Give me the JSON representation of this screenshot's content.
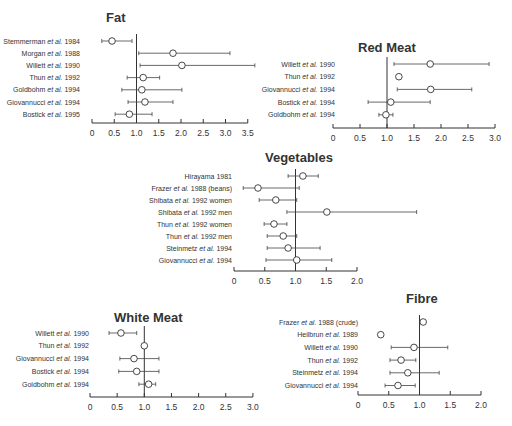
{
  "chart_data": [
    {
      "type": "forest",
      "title": "Fat",
      "xlim": [
        0,
        3.5
      ],
      "xticks": [
        "0",
        "0.5",
        "1.0",
        "1.5",
        "2.0",
        "2.5",
        "3.0",
        "3.5"
      ],
      "reference_line": 1.0,
      "layout": {
        "x0": 92,
        "unit": 44.5,
        "label_right": 80,
        "title_x": 106,
        "title_y": 22,
        "row_y0": 41,
        "row_dy": 12.2,
        "axis_y": 123
      },
      "studies": [
        {
          "label": "Stemmerman et al. 1984",
          "estimate": 0.45,
          "lower": 0.22,
          "upper": 0.9
        },
        {
          "label": "Morgan et al. 1988",
          "estimate": 1.82,
          "lower": 1.05,
          "upper": 3.1
        },
        {
          "label": "Willett et al. 1990",
          "estimate": 2.02,
          "lower": 1.08,
          "upper": 3.66
        },
        {
          "label": "Thun et al. 1992",
          "estimate": 1.15,
          "lower": 0.79,
          "upper": 1.52
        },
        {
          "label": "Goldbohm et al. 1994",
          "estimate": 1.12,
          "lower": 0.67,
          "upper": 2.02
        },
        {
          "label": "Giovannucci et al. 1994",
          "estimate": 1.19,
          "lower": 0.81,
          "upper": 1.82
        },
        {
          "label": "Bostick et al. 1995",
          "estimate": 0.84,
          "lower": 0.52,
          "upper": 1.35
        }
      ]
    },
    {
      "type": "forest",
      "title": "Red Meat",
      "xlim": [
        0,
        3.0
      ],
      "xticks": [
        "0",
        "0.5",
        "1.0",
        "1.5",
        "2.0",
        "2.5",
        "3.0"
      ],
      "reference_line": 1.0,
      "layout": {
        "x0": 333,
        "unit": 54,
        "label_right": 335,
        "title_x": 358,
        "title_y": 52,
        "row_y0": 64,
        "row_dy": 12.7,
        "axis_y": 128
      },
      "studies": [
        {
          "label": "Willett et al. 1990",
          "estimate": 1.8,
          "lower": 1.13,
          "upper": 2.89
        },
        {
          "label": "Thun et al. 1992",
          "estimate": 1.22,
          "lower": null,
          "upper": null
        },
        {
          "label": "Giovannucci et al. 1994",
          "estimate": 1.81,
          "lower": 1.19,
          "upper": 2.57
        },
        {
          "label": "Bostick et al. 1994",
          "estimate": 1.07,
          "lower": 0.65,
          "upper": 1.8
        },
        {
          "label": "Goldbohm et al. 1994",
          "estimate": 0.98,
          "lower": 0.85,
          "upper": 1.11
        }
      ]
    },
    {
      "type": "forest",
      "title": "Vegetables",
      "xlim": [
        0,
        2.0
      ],
      "xticks": [
        "0",
        "0.5",
        "1.0",
        "1.5",
        "2.0"
      ],
      "reference_line": 1.0,
      "layout": {
        "x0": 234,
        "unit": 61.5,
        "label_right": 232,
        "title_x": 265,
        "title_y": 162,
        "row_y0": 176,
        "row_dy": 12.0,
        "axis_y": 271
      },
      "studies": [
        {
          "label": "Hirayama 1981",
          "estimate": 1.12,
          "lower": 0.88,
          "upper": 1.37
        },
        {
          "label": "Frazer et al. 1988 (beans)",
          "estimate": 0.39,
          "lower": 0.15,
          "upper": 1.06
        },
        {
          "label": "Shibata et al. 1992 women",
          "estimate": 0.68,
          "lower": 0.41,
          "upper": 1.02
        },
        {
          "label": "Shibata et al. 1992 men",
          "estimate": 1.51,
          "lower": 0.86,
          "upper": 2.97
        },
        {
          "label": "Thun et al. 1992 women",
          "estimate": 0.65,
          "lower": 0.49,
          "upper": 0.86
        },
        {
          "label": "Thun et al. 1992 men",
          "estimate": 0.8,
          "lower": 0.54,
          "upper": 1.02
        },
        {
          "label": "Steinmetz et al. 1994",
          "estimate": 0.88,
          "lower": 0.54,
          "upper": 1.4
        },
        {
          "label": "Giovannucci et al. 1994",
          "estimate": 1.02,
          "lower": 0.52,
          "upper": 1.59
        }
      ]
    },
    {
      "type": "forest",
      "title": "White Meat",
      "xlim": [
        0,
        3.0
      ],
      "xticks": [
        "0",
        "0.5",
        "1.0",
        "1.5",
        "2.0",
        "2.5",
        "3.0"
      ],
      "reference_line": 1.0,
      "layout": {
        "x0": 90,
        "unit": 54.3,
        "label_right": 89,
        "title_x": 114,
        "title_y": 322,
        "row_y0": 333,
        "row_dy": 12.8,
        "axis_y": 397
      },
      "studies": [
        {
          "label": "Willett et al. 1990",
          "estimate": 0.57,
          "lower": 0.35,
          "upper": 0.86
        },
        {
          "label": "Thun et al. 1992",
          "estimate": 1.0,
          "lower": null,
          "upper": null
        },
        {
          "label": "Giovannucci et al. 1994",
          "estimate": 0.81,
          "lower": 0.55,
          "upper": 1.27
        },
        {
          "label": "Bostick et al. 1994",
          "estimate": 0.86,
          "lower": 0.53,
          "upper": 1.27
        },
        {
          "label": "Goldbohm et al. 1994",
          "estimate": 1.08,
          "lower": 0.9,
          "upper": 1.21
        }
      ]
    },
    {
      "type": "forest",
      "title": "Fibre",
      "xlim": [
        0,
        2.0
      ],
      "xticks": [
        "0",
        "0.5",
        "1.0",
        "1.5",
        "2.0"
      ],
      "reference_line": 1.0,
      "layout": {
        "x0": 358,
        "unit": 61.5,
        "label_right": 358,
        "title_x": 406,
        "title_y": 303,
        "row_y0": 322,
        "row_dy": 12.7,
        "axis_y": 395
      },
      "studies": [
        {
          "label": "Frazer et al. 1988 (crude)",
          "estimate": 1.06,
          "lower": null,
          "upper": null
        },
        {
          "label": "Heilbrun et al. 1989",
          "estimate": 0.37,
          "lower": null,
          "upper": null
        },
        {
          "label": "Willett et al. 1990",
          "estimate": 0.91,
          "lower": 0.54,
          "upper": 1.46
        },
        {
          "label": "Thun et al. 1992",
          "estimate": 0.7,
          "lower": 0.52,
          "upper": 0.94
        },
        {
          "label": "Steinmetz et al. 1994",
          "estimate": 0.81,
          "lower": 0.52,
          "upper": 1.32
        },
        {
          "label": "Giovannucci et al. 1994",
          "estimate": 0.65,
          "lower": 0.44,
          "upper": 0.93
        }
      ]
    }
  ]
}
